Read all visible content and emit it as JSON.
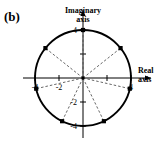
{
  "figure": {
    "panel_label": "(b)",
    "imaginary_axis_label_line1": "Imaginary",
    "imaginary_axis_label_line2": "axis",
    "real_axis_label_line1": "Real",
    "real_axis_label_line2": "axis",
    "ink_color": "#000000",
    "background_color": "#ffffff",
    "dashed_color": "#555555"
  },
  "chart_data": {
    "type": "scatter",
    "title": "(b)",
    "xlabel": "Real axis",
    "ylabel": "Imaginary axis",
    "xlim": [
      -5.2,
      5.2
    ],
    "ylim": [
      -5.2,
      5.2
    ],
    "grid": false,
    "legend": "none",
    "axis_style": "arrows-at-positive-ends",
    "x_ticks": [
      -4,
      -2,
      2,
      4
    ],
    "x_tick_labels": [
      "-4",
      "-2",
      "",
      "4"
    ],
    "y_ticks": [
      -4,
      -2,
      2,
      4
    ],
    "y_tick_labels": [
      "-4",
      "-2",
      "",
      "4"
    ],
    "circle": {
      "center": [
        0,
        0
      ],
      "radius": 4,
      "style": "solid-thick"
    },
    "radial_lines_style": "dashed",
    "marker": "square",
    "n_points": 7,
    "points": [
      {
        "index": 1,
        "angle_deg": 90,
        "x": 0.0,
        "y": 4.0
      },
      {
        "index": 2,
        "angle_deg": 38.57,
        "x": 3.13,
        "y": 2.49
      },
      {
        "index": 3,
        "angle_deg": -12.86,
        "x": 3.9,
        "y": -0.89
      },
      {
        "index": 4,
        "angle_deg": -64.29,
        "x": 1.74,
        "y": -3.6
      },
      {
        "index": 5,
        "angle_deg": -115.71,
        "x": -1.74,
        "y": -3.6
      },
      {
        "index": 6,
        "angle_deg": -167.14,
        "x": -3.9,
        "y": -0.89
      },
      {
        "index": 7,
        "angle_deg": 141.43,
        "x": -3.13,
        "y": 2.49
      }
    ]
  }
}
